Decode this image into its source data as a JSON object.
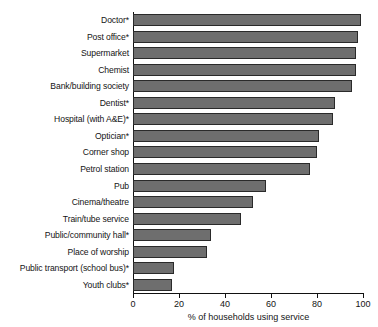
{
  "chart_data": {
    "type": "bar",
    "orientation": "horizontal",
    "title": "",
    "subtitle": "",
    "xlabel": "% of households using service",
    "ylabel": "",
    "xlim": [
      0,
      100
    ],
    "xticks": [
      0,
      20,
      40,
      60,
      80,
      100
    ],
    "xtick_labels": [
      "0",
      "20",
      "40",
      "60",
      "80",
      "100"
    ],
    "grid": false,
    "legend": null,
    "bar_color": "#6e6e6e",
    "bar_edge_color": "#2a2a2a",
    "categories": [
      "Doctor*",
      "Post office*",
      "Supermarket",
      "Chemist",
      "Bank/building society",
      "Dentist*",
      "Hospital (with A&E)*",
      "Optician*",
      "Corner shop",
      "Petrol station",
      "Pub",
      "Cinema/theatre",
      "Train/tube service",
      "Public/community hall*",
      "Place of worship",
      "Public transport (school bus)*",
      "Youth clubs*"
    ],
    "values": [
      99,
      98,
      97,
      97,
      95,
      88,
      87,
      81,
      80,
      77,
      58,
      52,
      47,
      34,
      32,
      18,
      17
    ]
  }
}
